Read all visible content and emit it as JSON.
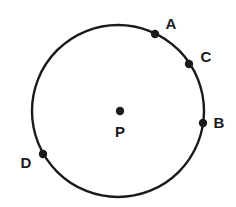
{
  "diagram": {
    "circle": {
      "cx": 118,
      "cy": 111,
      "r": 86,
      "stroke": "#1a1a1a",
      "stroke_width": 2.4
    },
    "center": {
      "label": "P",
      "x": 120,
      "y": 111,
      "label_x": 120,
      "label_y": 137
    },
    "points": [
      {
        "label": "A",
        "x": 155,
        "y": 34,
        "label_x": 171,
        "label_y": 29
      },
      {
        "label": "C",
        "x": 189,
        "y": 64,
        "label_x": 206,
        "label_y": 62
      },
      {
        "label": "B",
        "x": 203,
        "y": 123,
        "label_x": 219,
        "label_y": 128
      },
      {
        "label": "D",
        "x": 43,
        "y": 154,
        "label_x": 26,
        "label_y": 168
      }
    ],
    "dot_radius": 4.2,
    "dot_color": "#1a1a1a"
  }
}
